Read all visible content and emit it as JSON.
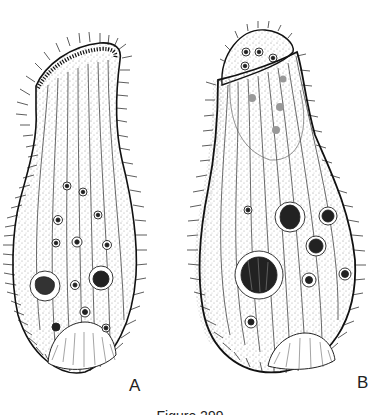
{
  "figure": {
    "panels": [
      {
        "label": "A",
        "description": "Ciliate, elongated flask-shaped body with oral ciliary band at top, nuclei and vacuoles, basal clear region"
      },
      {
        "label": "B",
        "description": "Ciliate, broad oval body with retracted anterior cap containing small granules, large nuclei, basal clear region"
      }
    ],
    "caption": "Figure 299"
  }
}
